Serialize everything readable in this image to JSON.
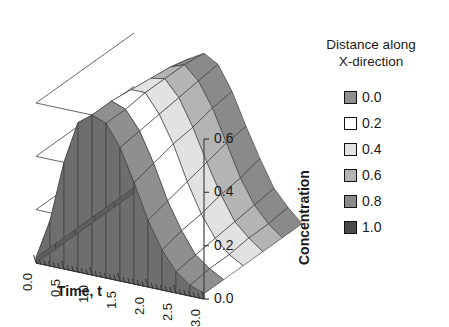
{
  "chart_data": {
    "type": "line",
    "subtype": "3d-surface-wireframe",
    "title": "",
    "xlabel": "Time, t",
    "ylabel": "Concentration",
    "zlabel": "Distance along X-direction",
    "x": [
      0.0,
      0.25,
      0.5,
      0.75,
      1.0,
      1.25,
      1.5,
      1.75,
      2.0,
      2.25,
      2.5,
      2.75,
      3.0
    ],
    "xlim": [
      0.0,
      3.0
    ],
    "xticks": [
      "0.0",
      "0.5",
      "1.0",
      "1.5",
      "2.0",
      "2.5",
      "3.0"
    ],
    "xtick_values": [
      0.0,
      0.5,
      1.0,
      1.5,
      2.0,
      2.5,
      3.0
    ],
    "ylim": [
      0.0,
      0.6
    ],
    "yticks": [
      "0.0",
      "0.2",
      "0.4",
      "0.6"
    ],
    "ytick_values": [
      0.0,
      0.2,
      0.4,
      0.6
    ],
    "grid": true,
    "legend_position": "right",
    "legend_title_lines": [
      "Distance along",
      "X-direction"
    ],
    "series": [
      {
        "name": "0.0",
        "color": "#8f8f8f",
        "values": [
          0.02,
          0.17,
          0.4,
          0.56,
          0.6,
          0.58,
          0.5,
          0.38,
          0.25,
          0.15,
          0.08,
          0.04,
          0.02
        ]
      },
      {
        "name": "0.2",
        "color": "#ffffff",
        "values": [
          0.02,
          0.15,
          0.37,
          0.54,
          0.6,
          0.58,
          0.51,
          0.4,
          0.27,
          0.17,
          0.09,
          0.05,
          0.02
        ]
      },
      {
        "name": "0.4",
        "color": "#e2e2e2",
        "values": [
          0.02,
          0.13,
          0.34,
          0.52,
          0.59,
          0.59,
          0.52,
          0.42,
          0.29,
          0.18,
          0.1,
          0.05,
          0.02
        ]
      },
      {
        "name": "0.6",
        "color": "#b4b4b4",
        "values": [
          0.02,
          0.11,
          0.3,
          0.49,
          0.58,
          0.59,
          0.53,
          0.43,
          0.31,
          0.2,
          0.11,
          0.06,
          0.02
        ]
      },
      {
        "name": "0.8",
        "color": "#8a8a8a",
        "values": [
          0.02,
          0.09,
          0.27,
          0.46,
          0.57,
          0.59,
          0.54,
          0.45,
          0.33,
          0.21,
          0.12,
          0.06,
          0.02
        ]
      },
      {
        "name": "1.0",
        "color": "#4a4a4a",
        "values": [
          0.02,
          0.07,
          0.24,
          0.43,
          0.55,
          0.58,
          0.55,
          0.46,
          0.34,
          0.23,
          0.13,
          0.07,
          0.02
        ]
      }
    ]
  },
  "axes": {
    "x_title": "Time, t",
    "y_title": "Concentration",
    "x_tick_labels": [
      "0.0",
      "0.5",
      "1.0",
      "1.5",
      "2.0",
      "2.5",
      "3.0"
    ],
    "y_tick_labels": [
      "0.0",
      "0.2",
      "0.4",
      "0.6"
    ]
  },
  "legend": {
    "title_line1": "Distance along",
    "title_line2": "X-direction",
    "items": [
      {
        "label": "0.0",
        "color": "#8f8f8f"
      },
      {
        "label": "0.2",
        "color": "#ffffff"
      },
      {
        "label": "0.4",
        "color": "#e2e2e2"
      },
      {
        "label": "0.6",
        "color": "#b4b4b4"
      },
      {
        "label": "0.8",
        "color": "#8a8a8a"
      },
      {
        "label": "1.0",
        "color": "#4a4a4a"
      }
    ]
  }
}
